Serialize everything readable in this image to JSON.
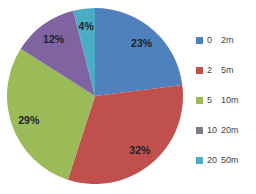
{
  "chart_data": {
    "type": "pie",
    "title": "",
    "categories": [
      "0 2m",
      "2 5m",
      "5 10m",
      "10 20m",
      "20 50m"
    ],
    "values": [
      23,
      32,
      29,
      12,
      4
    ],
    "data_labels": [
      "23%",
      "32%",
      "29%",
      "12%",
      "4%"
    ],
    "slice_colors": [
      "#4f81bd",
      "#c0504d",
      "#9bbb59",
      "#8064a2",
      "#4bacc6"
    ],
    "start_angle_deg": 0,
    "direction": "clockwise",
    "legend_position": "right",
    "label_color": "#21212b",
    "background": "#ffffff"
  },
  "legend": {
    "items": [
      {
        "start": "0",
        "end": "2m",
        "swatch_color": "#4f81bd"
      },
      {
        "start": "2",
        "end": "5m",
        "swatch_color": "#c0504d"
      },
      {
        "start": "5",
        "end": "10m",
        "swatch_color": "#9bbb59"
      },
      {
        "start": "10",
        "end": "20m",
        "swatch_color": "#7d7a83"
      },
      {
        "start": "20",
        "end": "50m",
        "swatch_color": "#4bacc6"
      }
    ]
  }
}
